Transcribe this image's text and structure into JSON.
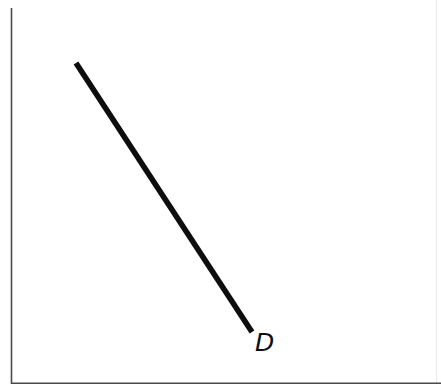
{
  "figure": {
    "background_color": "#ffffff",
    "width": 441,
    "height": 391
  },
  "axes": {
    "vertical": {
      "name": "price-axis",
      "color": "#4a4a4a",
      "x": 11,
      "y_top": 8,
      "y_bottom": 384,
      "label": ""
    },
    "horizontal": {
      "name": "quantity-axis",
      "color": "#4a4a4a",
      "y": 383,
      "x_left": 11,
      "x_right": 441,
      "label": ""
    },
    "right_edge": {
      "name": "faint-right-border",
      "color": "#e9e9e9",
      "x": 436
    }
  },
  "chart_data": {
    "type": "line",
    "xlabel": "",
    "ylabel": "",
    "grid": false,
    "legend": "none",
    "annotations": [
      {
        "text": "D",
        "x": 256,
        "y": 333,
        "style": "italic",
        "color": "#0d0d0d",
        "font_size": 25
      }
    ],
    "series": [
      {
        "name": "D",
        "label": "D",
        "color": "#0d0d0d",
        "line_width": 5.6,
        "points": [
          {
            "x": 76,
            "y": 63
          },
          {
            "x": 252,
            "y": 332
          }
        ],
        "slope": -1.528,
        "description": "downward-sloping straight demand curve"
      }
    ],
    "xlim": [
      11,
      441
    ],
    "ylim": [
      383,
      8
    ]
  },
  "labels": {
    "demand_curve": "D"
  }
}
